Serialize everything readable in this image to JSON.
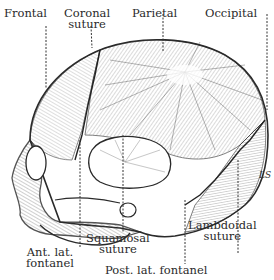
{
  "figure": {
    "signature": "LS"
  },
  "labels": {
    "frontal": "Frontal",
    "coronal_line1": "Coronal",
    "coronal_line2": "suture",
    "parietal": "Parietal",
    "occipital": "Occipital",
    "ant_lat_line1": "Ant. lat.",
    "ant_lat_line2": "fontanel",
    "squamosal_line1": "Squamosal",
    "squamosal_line2": "suture",
    "lambdoidal_line1": "Lambdoidal",
    "lambdoidal_line2": "suture",
    "post_lat": "Post. lat. fontanel"
  },
  "colors": {
    "ink": "#2a2a2a",
    "background": "#ffffff"
  }
}
